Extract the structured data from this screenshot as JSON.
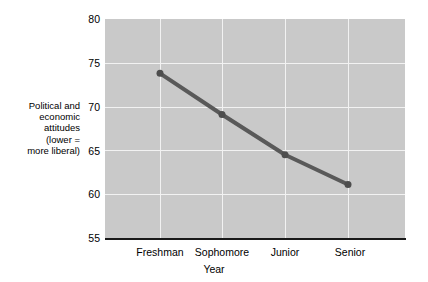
{
  "chart_data": {
    "type": "line",
    "title": "",
    "xlabel": "Year",
    "ylabel": "Political and economic attitudes (lower = more liberal)",
    "ylabel_lines": [
      "Political and",
      "economic",
      "attitudes",
      "(lower =",
      "more liberal)"
    ],
    "categories": [
      "Freshman",
      "Sophomore",
      "Junior",
      "Senior"
    ],
    "values": [
      73.8,
      69.1,
      64.5,
      61.1
    ],
    "ylim": [
      55,
      80
    ],
    "yticks": [
      80,
      75,
      70,
      65,
      60,
      55
    ],
    "ytick_labels": [
      "80",
      "75",
      "70",
      "65",
      "60",
      "55"
    ],
    "grid": true,
    "legend": "none",
    "colors": {
      "plot_background": "#c9c9c9",
      "gridline": "#f2f2f2",
      "series_line": "#595959",
      "marker": "#4d4d4d",
      "axis": "#1a1a1a",
      "text": "#000000",
      "page_background": "#ffffff"
    },
    "series_style": {
      "line_width": 4,
      "marker": "circle",
      "marker_size": 5
    }
  }
}
